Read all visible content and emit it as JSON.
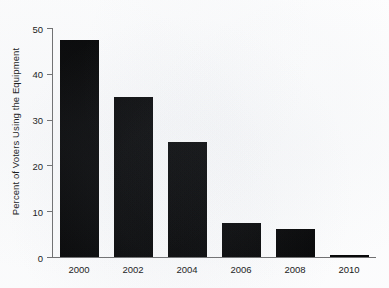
{
  "chart_data": {
    "type": "bar",
    "title": "",
    "subtitle": "",
    "xlabel": "",
    "ylabel": "Percent of Voters Using the Equipment",
    "categories": [
      "2000",
      "2002",
      "2004",
      "2006",
      "2008",
      "2010"
    ],
    "values": [
      47.3,
      35.0,
      25.1,
      7.5,
      6.2,
      0.4
    ],
    "series": [
      {
        "name": "Percent of Voters Using the Equipment",
        "values": [
          47.3,
          35.0,
          25.1,
          7.5,
          6.2,
          0.4
        ]
      }
    ],
    "ylim": [
      0,
      50
    ],
    "xlim_note": "categorical",
    "yticks": [
      0,
      10,
      20,
      30,
      40,
      50
    ],
    "ytick_labels": [
      "0",
      "10",
      "20",
      "30",
      "40",
      "50"
    ],
    "xtick_labels": [
      "2000",
      "2002",
      "2004",
      "2006",
      "2008",
      "2010"
    ],
    "grid": false,
    "legend": false,
    "legend_position": "none",
    "annotations": [],
    "colors": {
      "bar": "#000000",
      "axis": "#6d6d6d",
      "text": "#111111",
      "background": "#ffffff"
    }
  }
}
